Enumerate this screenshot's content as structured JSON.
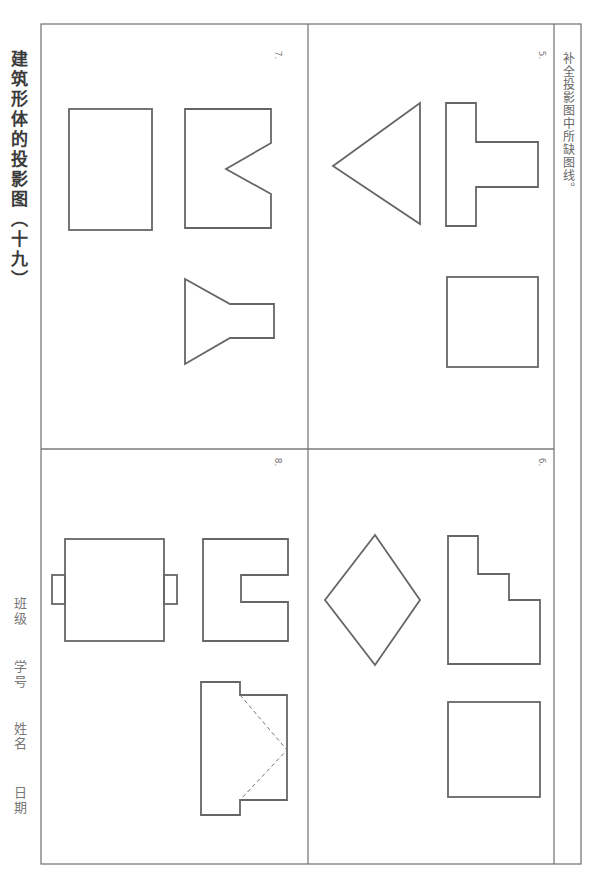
{
  "page": {
    "title": "建筑形体的投影图（十九）",
    "instruction": "补全投影图中所缺图线。",
    "info_fields": [
      {
        "label": "班级"
      },
      {
        "label": "学号"
      },
      {
        "label": "姓名"
      },
      {
        "label": "日期"
      }
    ],
    "problems": [
      {
        "number": "5.",
        "shapes": [
          "triangle",
          "t-shape",
          "square"
        ]
      },
      {
        "number": "6.",
        "shapes": [
          "diamond",
          "stepped-shape",
          "square"
        ]
      },
      {
        "number": "7.",
        "shapes": [
          "rectangle",
          "v-notch-shape",
          "funnel-shape"
        ]
      },
      {
        "number": "8.",
        "shapes": [
          "rectangle-with-tabs",
          "u-slot-shape",
          "stepped-shape-with-hidden-lines"
        ]
      }
    ],
    "colors": {
      "line": "#6a6a6a",
      "border": "#7a7a7a",
      "text": "#555555"
    }
  }
}
